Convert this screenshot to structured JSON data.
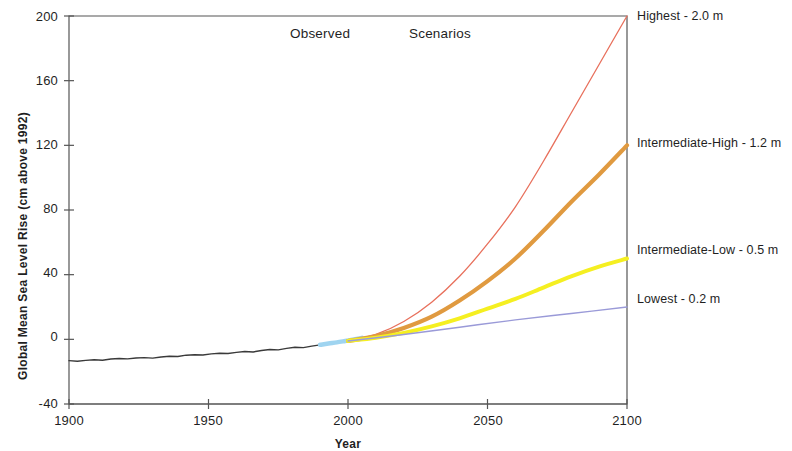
{
  "chart_data": {
    "type": "line",
    "title": "",
    "xlabel": "Year",
    "ylabel": "Global Mean Sea Level Rise (cm above 1992)",
    "xlim": [
      1900,
      2100
    ],
    "ylim": [
      -40,
      200
    ],
    "xticks": [
      "1900",
      "1950",
      "2000",
      "2050",
      "2100"
    ],
    "xtick_values": [
      1900,
      1950,
      2000,
      2050,
      2100
    ],
    "yticks": [
      "-40",
      "0",
      "40",
      "80",
      "120",
      "160",
      "200"
    ],
    "ytick_values": [
      -40,
      0,
      40,
      80,
      120,
      160,
      200
    ],
    "grid": false,
    "legend_position": "right-inline-annotations",
    "annotations": [
      {
        "text": "Observed",
        "x": 1955,
        "y": 193
      },
      {
        "text": "Scenarios",
        "x": 1998,
        "y": 193
      }
    ],
    "series": [
      {
        "name": "Observed",
        "label": "",
        "color": "#3a3a3a",
        "width": 1.4,
        "x": [
          1900,
          1903,
          1906,
          1909,
          1912,
          1915,
          1918,
          1921,
          1924,
          1927,
          1930,
          1933,
          1936,
          1939,
          1942,
          1945,
          1948,
          1951,
          1954,
          1957,
          1960,
          1963,
          1966,
          1969,
          1972,
          1975,
          1978,
          1981,
          1984,
          1987,
          1990,
          1992
        ],
        "y": [
          -13.2,
          -13.6,
          -13.0,
          -12.6,
          -12.9,
          -12.2,
          -11.9,
          -12.1,
          -11.5,
          -11.3,
          -11.6,
          -10.9,
          -10.5,
          -10.6,
          -9.8,
          -9.5,
          -9.7,
          -9.0,
          -8.6,
          -8.8,
          -8.1,
          -7.5,
          -7.8,
          -6.9,
          -6.3,
          -6.5,
          -5.6,
          -4.9,
          -5.1,
          -4.2,
          -3.4,
          -2.6
        ]
      },
      {
        "name": "Transition",
        "label": "",
        "color": "#9fd4f0",
        "width": 4.5,
        "x": [
          1990,
          1993,
          1996,
          1999,
          2002,
          2005
        ],
        "y": [
          -3.4,
          -2.6,
          -1.9,
          -1.0,
          -0.1,
          0.9
        ]
      },
      {
        "name": "Highest",
        "label": "Highest - 2.0 m",
        "value_m": 2.0,
        "end_cm": 200,
        "color": "#e8705c",
        "width": 1.3,
        "x": [
          2000,
          2010,
          2020,
          2030,
          2040,
          2050,
          2060,
          2070,
          2080,
          2090,
          2100
        ],
        "y": [
          -1.0,
          3.0,
          11.0,
          23.0,
          39.0,
          59.0,
          82.0,
          110.0,
          140.0,
          170.0,
          200.0
        ]
      },
      {
        "name": "Intermediate-High",
        "label": "Intermediate-High - 1.2 m",
        "value_m": 1.2,
        "end_cm": 120,
        "color": "#e09a40",
        "width": 4.2,
        "x": [
          2000,
          2010,
          2020,
          2030,
          2040,
          2050,
          2060,
          2070,
          2080,
          2090,
          2100
        ],
        "y": [
          -1.0,
          2.0,
          7.0,
          14.0,
          24.0,
          36.0,
          50.0,
          67.0,
          85.0,
          102.0,
          120.0
        ]
      },
      {
        "name": "Intermediate-Low",
        "label": "Intermediate-Low - 0.5 m",
        "value_m": 0.5,
        "end_cm": 50,
        "color": "#f5ef21",
        "width": 4.0,
        "x": [
          2000,
          2010,
          2020,
          2030,
          2040,
          2050,
          2060,
          2070,
          2080,
          2090,
          2100
        ],
        "y": [
          -1.0,
          1.0,
          4.0,
          8.0,
          13.0,
          19.0,
          25.0,
          32.0,
          39.0,
          45.0,
          50.0
        ]
      },
      {
        "name": "Lowest",
        "label": "Lowest - 0.2 m",
        "value_m": 0.2,
        "end_cm": 20,
        "color": "#9a9ad8",
        "width": 1.4,
        "x": [
          2000,
          2020,
          2040,
          2060,
          2080,
          2100
        ],
        "y": [
          -1.0,
          3.0,
          7.5,
          12.0,
          16.0,
          20.0
        ]
      }
    ]
  },
  "axes": {
    "y_title": "Global Mean Sea Level Rise (cm above 1992)",
    "x_title": "Year",
    "ytick_labels": [
      "200",
      "160",
      "120",
      "80",
      "40",
      "0",
      "-40"
    ],
    "xtick_labels": [
      "1900",
      "1950",
      "2000",
      "2050",
      "2100"
    ]
  },
  "plot_annotations": {
    "observed": "Observed",
    "scenarios": "Scenarios"
  },
  "series_labels": {
    "highest": "Highest - 2.0 m",
    "intermediate_high": "Intermediate-High - 1.2 m",
    "intermediate_low": "Intermediate-Low - 0.5 m",
    "lowest": "Lowest - 0.2 m"
  },
  "colors": {
    "observed": "#3a3a3a",
    "transition": "#9fd4f0",
    "highest": "#e8705c",
    "intermediate_high": "#e09a40",
    "intermediate_low": "#f5ef21",
    "lowest": "#9a9ad8",
    "axis": "#555555",
    "text": "#1f1f1f",
    "background": "#ffffff"
  }
}
